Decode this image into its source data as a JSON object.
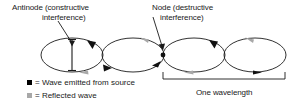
{
  "diagram": {
    "title_absent": true,
    "annotations": [
      {
        "name": "antinode",
        "line1": "Antinode (constructive",
        "line2": "interference)",
        "leader": {
          "from": [
            58,
            21
          ],
          "to": [
            73,
            45
          ]
        }
      },
      {
        "name": "node",
        "line1": "Node (destructive",
        "line2": "interference)",
        "leader": {
          "from": [
            153,
            17
          ],
          "to": [
            163,
            49
          ]
        }
      }
    ],
    "wavelength_label": "One wavelength",
    "bracket": {
      "x1": 163,
      "x2": 285,
      "y": 79,
      "tick": 6
    },
    "loops": [
      {
        "cx": 72,
        "cy": 55,
        "rx": 31,
        "ry": 17
      },
      {
        "cx": 133,
        "cy": 55,
        "rx": 31,
        "ry": 17
      },
      {
        "cx": 194,
        "cy": 55,
        "rx": 31,
        "ry": 17
      },
      {
        "cx": 255,
        "cy": 55,
        "rx": 31,
        "ry": 17
      }
    ],
    "amplitude_marker": {
      "x": 72,
      "y_top": 40,
      "y_bottom": 70,
      "cap_width": 8
    },
    "node_dot": {
      "x": 163,
      "y": 55,
      "r": 2.4
    },
    "arrows": [
      {
        "loop": 1,
        "position": "top-right",
        "color": "#111111",
        "direction": "clockwise-down"
      },
      {
        "loop": 1,
        "position": "bottom-right",
        "color": "#a8a8a8",
        "direction": "leftward"
      },
      {
        "loop": 2,
        "position": "top-right",
        "color": "#a8a8a8",
        "direction": "leftward"
      },
      {
        "loop": 2,
        "position": "bottom-left",
        "color": "#111111",
        "direction": "rightward-down"
      },
      {
        "loop": 2,
        "position": "bottom-right",
        "color": "#111111",
        "direction": "rightward-up"
      },
      {
        "loop": 3,
        "position": "top-right",
        "color": "#111111",
        "direction": "clockwise-down"
      },
      {
        "loop": 3,
        "position": "bottom-right",
        "color": "#a8a8a8",
        "direction": "leftward"
      },
      {
        "loop": 4,
        "position": "top-right",
        "color": "#a8a8a8",
        "direction": "leftward"
      },
      {
        "loop": 4,
        "position": "bottom-right",
        "color": "#111111",
        "direction": "rightward"
      }
    ]
  },
  "legend": {
    "items": [
      {
        "marker": "black-square",
        "color": "#000000",
        "text": "= Wave emitted from source"
      },
      {
        "marker": "gray-square",
        "color": "#a8a8a8",
        "text": "= Reflected wave"
      }
    ]
  },
  "colors": {
    "ink": "#1a1a1a",
    "emitted": "#000000",
    "reflected": "#a8a8a8",
    "background": "#ffffff"
  }
}
